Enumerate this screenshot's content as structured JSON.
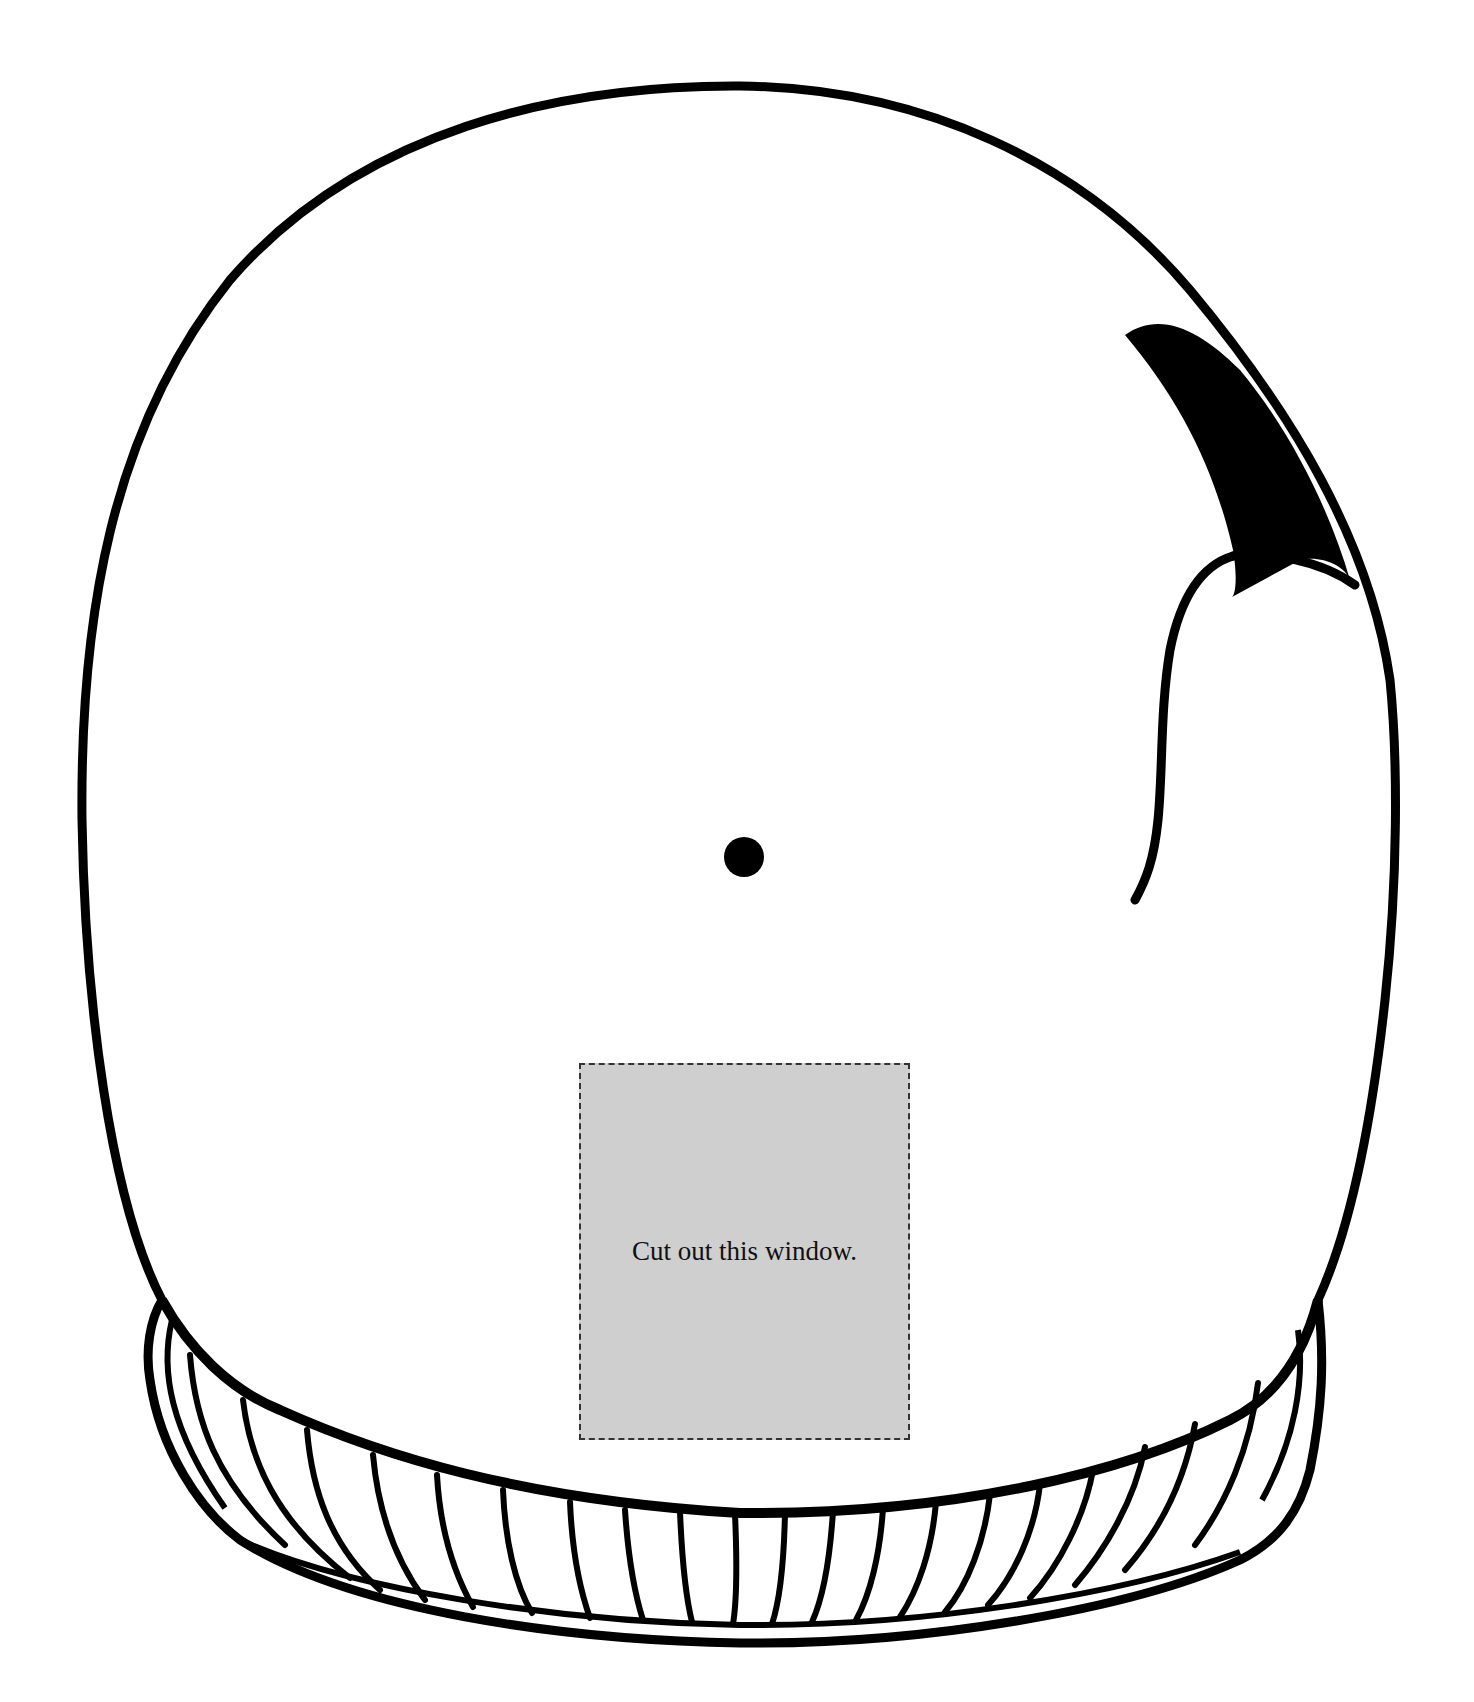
{
  "page": {
    "type": "printable craft template"
  },
  "window_cutout": {
    "label": "Cut out this window.",
    "fill_color": "#cfcfcf",
    "border_style": "dashed"
  },
  "colors": {
    "outline": "#000000",
    "background": "#ffffff",
    "window_fill": "#cfcfcf"
  }
}
